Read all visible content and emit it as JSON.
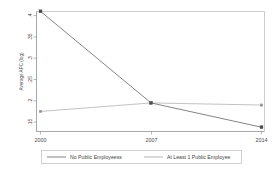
{
  "chart_data": {
    "type": "line",
    "title": "",
    "subtitle": "",
    "xlabel": "",
    "ylabel": "Average APC (log)",
    "x": [
      2000,
      2007,
      2014
    ],
    "xtick_labels": [
      "2000",
      "2007",
      "2014"
    ],
    "ytick_labels": [
      ".15",
      ".2",
      ".25",
      ".3",
      ".35",
      ".4"
    ],
    "ytick_values": [
      0.15,
      0.2,
      0.25,
      0.3,
      0.35,
      0.4
    ],
    "ylim": [
      0.13,
      0.42
    ],
    "xlim": [
      2000,
      2014
    ],
    "grid": false,
    "legend_position": "bottom",
    "series": [
      {
        "name": "No Public Employeess",
        "values": [
          0.41,
          0.195,
          0.138
        ],
        "color": "#6e6e6e",
        "marker": "square"
      },
      {
        "name": "At Least 1 Public Employee",
        "values": [
          0.175,
          0.195,
          0.19
        ],
        "color": "#a8a8a8",
        "marker": "square"
      }
    ]
  },
  "legend": {
    "items": [
      {
        "label": "No Public Employeess",
        "color": "#6e6e6e"
      },
      {
        "label": "At Least 1 Public Employee",
        "color": "#a8a8a8"
      }
    ]
  },
  "axes": {
    "y_title": "Average APC (log)",
    "y_ticks": [
      ".4",
      ".35",
      ".3",
      ".25",
      ".2",
      ".15"
    ],
    "x_ticks": [
      "2000",
      "2007",
      "2014"
    ]
  }
}
